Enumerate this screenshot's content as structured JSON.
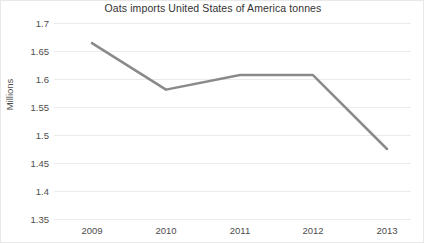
{
  "chart_data": {
    "type": "line",
    "title": "Oats imports United States of America tonnes",
    "xlabel": "",
    "ylabel": "Millions",
    "categories": [
      "2009",
      "2010",
      "2011",
      "2012",
      "2013"
    ],
    "values": [
      1.664,
      1.581,
      1.607,
      1.607,
      1.475
    ],
    "series": [
      {
        "name": "Oats imports United States of America tonnes",
        "values": [
          1.664,
          1.581,
          1.607,
          1.607,
          1.475
        ]
      }
    ],
    "ylim": [
      1.35,
      1.7
    ],
    "ytick_labels": [
      "1.7",
      "1.65",
      "1.6",
      "1.55",
      "1.5",
      "1.45",
      "1.4",
      "1.35"
    ],
    "ytick_values": [
      1.7,
      1.65,
      1.6,
      1.55,
      1.5,
      1.45,
      1.4,
      1.35
    ],
    "xtick_labels": [
      "2009",
      "2010",
      "2011",
      "2012",
      "2013"
    ],
    "grid": "horizontal",
    "legend": "none",
    "colors": {
      "line": "#8a8a8a",
      "gridline": "#ebebeb",
      "text": "#4d4d4d",
      "title": "#333333",
      "background": "#ffffff",
      "border": "#e8e8e8"
    },
    "line_width": 2.5,
    "markers": "none",
    "units": "Millions of tonnes"
  }
}
